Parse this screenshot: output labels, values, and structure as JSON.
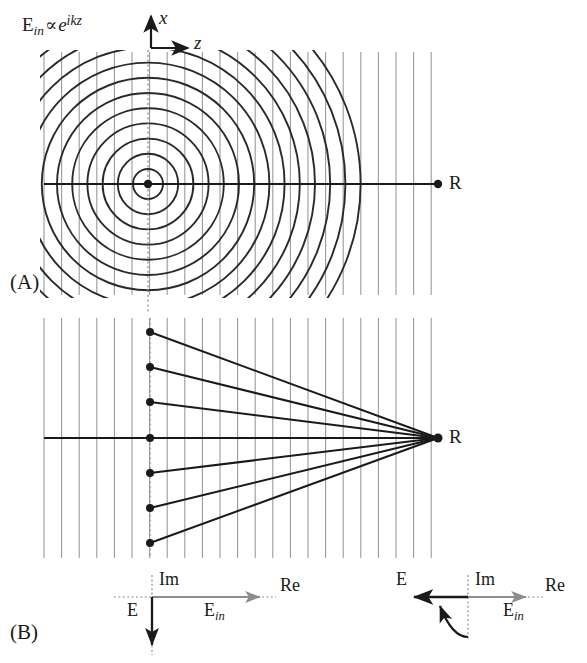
{
  "figure": {
    "type": "scientific-diagram",
    "background_color": "#ffffff",
    "ink_color": "#1a1a1a",
    "grid_color": "#9a9a9a"
  },
  "panels": [
    {
      "id": "A",
      "label": "(A)",
      "label_x": 10,
      "label_y": 273,
      "formula": {
        "e_main": "E",
        "e_sub": "in",
        "proportional": "∝",
        "exp_base": "e",
        "exp_power": "ikz",
        "x": 22,
        "y": 14
      },
      "axes": {
        "origin_x": 151,
        "origin_y": 48,
        "vertical_label": "x",
        "vertical_label_x": 158,
        "vertical_label_y": 10,
        "horizontal_label": "z",
        "horizontal_label_x": 193,
        "horizontal_label_y": 36,
        "arm_up": 34,
        "arm_right": 38
      },
      "source_point": {
        "x": 148,
        "y": 184,
        "radius": 4.2
      },
      "detector_point": {
        "x": 438,
        "y": 184,
        "radius": 4.2,
        "label": "R",
        "label_x": 449,
        "label_y": 174
      },
      "optical_axis": {
        "x1": 44,
        "x2": 438,
        "y": 184
      },
      "source_vertical_dotted": {
        "x": 148,
        "y1": 50,
        "y2": 312
      },
      "grid": {
        "x_start": 44,
        "x_end": 440,
        "spacing": 17.6,
        "y_top": 52,
        "y_bottom": 295
      },
      "circles": {
        "count": 14,
        "first_radius": 15,
        "spacing": 15.2,
        "center_x": 148,
        "center_y": 184
      }
    },
    {
      "id": "B",
      "label": "(B)",
      "label_x": 10,
      "label_y": 624,
      "aperture_x": 150,
      "grid": {
        "x_start": 44,
        "x_end": 440,
        "spacing": 17.6,
        "y_top": 318,
        "y_bottom": 558
      },
      "optical_axis": {
        "x1": 44,
        "x2": 438,
        "y": 438
      },
      "aperture_dotted": {
        "x": 150,
        "y1": 318,
        "y2": 558
      },
      "detector_point": {
        "x": 438,
        "y": 438,
        "radius": 4.5,
        "label": "R",
        "label_x": 449,
        "label_y": 428
      },
      "aperture_points": [
        {
          "x": 150,
          "y": 332
        },
        {
          "x": 150,
          "y": 367
        },
        {
          "x": 150,
          "y": 402
        },
        {
          "x": 150,
          "y": 438
        },
        {
          "x": 150,
          "y": 473
        },
        {
          "x": 150,
          "y": 508
        },
        {
          "x": 150,
          "y": 543
        }
      ]
    }
  ],
  "insets": [
    {
      "id": "inset-left",
      "name": "phasor-plane-without-gouy",
      "origin_x": 152,
      "origin_y": 597,
      "im_label": "Im",
      "im_label_x": 158,
      "im_label_y": 572,
      "re_label": "Re",
      "re_label_x": 280,
      "re_label_y": 578,
      "ein_label_main": "E",
      "ein_label_sub": "in",
      "ein_label_x": 206,
      "ein_label_y": 601,
      "e_label": "E",
      "e_label_x": 128,
      "e_label_y": 601,
      "e_arrow_direction": "down",
      "e_arrow_length": 46,
      "ein_arrow_direction": "right",
      "ein_arrow_length": 116,
      "has_rotation_arc": false,
      "axis_up_length": 22,
      "axis_left_length": 38,
      "axis_down_length": 56
    },
    {
      "id": "inset-right",
      "name": "phasor-plane-with-gouy",
      "origin_x": 468,
      "origin_y": 597,
      "im_label": "Im",
      "im_label_x": 474,
      "im_label_y": 572,
      "re_label": "Re",
      "re_label_x": 545,
      "re_label_y": 578,
      "ein_label_main": "E",
      "ein_label_sub": "in",
      "ein_label_x": 505,
      "ein_label_y": 601,
      "e_label": "E",
      "e_label_x": 398,
      "e_label_y": 572,
      "e_arrow_direction": "left",
      "e_arrow_length": 56,
      "ein_arrow_direction": "right",
      "ein_arrow_length": 76,
      "has_rotation_arc": true,
      "axis_up_length": 22,
      "axis_down_length": 42
    }
  ],
  "text_items": {
    "panel_a_label": "(A)",
    "panel_b_label": "(B)",
    "axis_x": "x",
    "axis_z": "z",
    "point_r_a": "R",
    "point_r_b": "R",
    "im_left": "Im",
    "re_left": "Re",
    "im_right": "Im",
    "re_right": "Re",
    "e_left": "E",
    "e_right": "E",
    "ein_left_main": "E",
    "ein_left_sub": "in",
    "ein_right_main": "E",
    "ein_right_sub": "in"
  }
}
